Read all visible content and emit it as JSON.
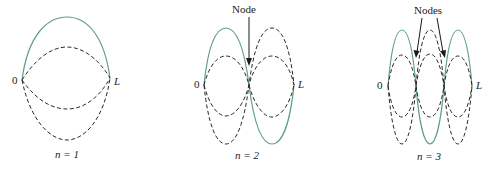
{
  "figure": {
    "colors": {
      "fundamental_mode": "#5f9e88",
      "other_positions": "#2a2a2a"
    },
    "panels": [
      {
        "n": 1,
        "n_label": "n = 1",
        "left_label": "0",
        "right_label": "L",
        "callout": null,
        "node_count": 0
      },
      {
        "n": 2,
        "n_label": "n = 2",
        "left_label": "0",
        "right_label": "L",
        "callout": "Node",
        "node_count": 1
      },
      {
        "n": 3,
        "n_label": "n = 3",
        "left_label": "0",
        "right_label": "L",
        "callout": "Nodes",
        "node_count": 2
      }
    ]
  }
}
